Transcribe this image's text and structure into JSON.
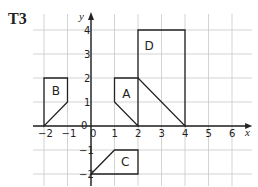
{
  "question_label": "T3",
  "axes": {
    "x_label": "x",
    "y_label": "y",
    "x_ticks": [
      "-2",
      "-1",
      "0",
      "1",
      "2",
      "3",
      "4",
      "5",
      "6"
    ],
    "y_ticks": [
      "-2",
      "-1",
      "0",
      "1",
      "2",
      "3",
      "4"
    ],
    "origin_label": "0"
  },
  "shapes": [
    {
      "name": "A",
      "vertices": [
        [
          1,
          1
        ],
        [
          1,
          2
        ],
        [
          2,
          2
        ],
        [
          2,
          0
        ]
      ]
    },
    {
      "name": "B",
      "vertices": [
        [
          -2,
          0
        ],
        [
          -2,
          2
        ],
        [
          -1,
          2
        ],
        [
          -1,
          1
        ]
      ]
    },
    {
      "name": "C",
      "vertices": [
        [
          0,
          -2
        ],
        [
          1,
          -1
        ],
        [
          2,
          -1
        ],
        [
          2,
          -2
        ]
      ]
    },
    {
      "name": "D",
      "vertices": [
        [
          2,
          2
        ],
        [
          2,
          4
        ],
        [
          4,
          4
        ],
        [
          4,
          0
        ]
      ]
    }
  ],
  "colors": {
    "grid": "#c8c8c8",
    "axis": "#222222",
    "shape": "#222222"
  }
}
